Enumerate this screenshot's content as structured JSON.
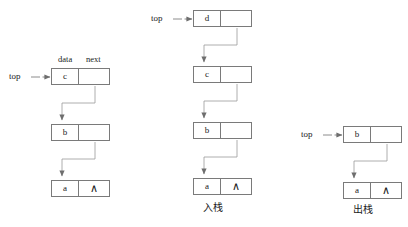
{
  "diagram": {
    "stroke_color": "#7a7a7a",
    "text_color": "#1a1a1a",
    "background": "#ffffff",
    "field_labels": {
      "data": "data",
      "next": "next"
    },
    "pointer_label": "top",
    "null_symbol": "∧",
    "columns": [
      {
        "id": "initial",
        "caption": "",
        "pointer": "top",
        "show_field_labels": true,
        "nodes": [
          {
            "data": "c",
            "next": ""
          },
          {
            "data": "b",
            "next": ""
          },
          {
            "data": "a",
            "next": "∧"
          }
        ]
      },
      {
        "id": "push",
        "caption": "入栈",
        "pointer": "top",
        "show_field_labels": false,
        "nodes": [
          {
            "data": "d",
            "next": ""
          },
          {
            "data": "c",
            "next": ""
          },
          {
            "data": "b",
            "next": ""
          },
          {
            "data": "a",
            "next": "∧"
          }
        ]
      },
      {
        "id": "pop",
        "caption": "出栈",
        "pointer": "top",
        "show_field_labels": false,
        "nodes": [
          {
            "data": "b",
            "next": ""
          },
          {
            "data": "a",
            "next": "∧"
          }
        ]
      }
    ]
  }
}
